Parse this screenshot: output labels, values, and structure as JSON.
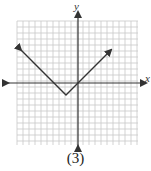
{
  "caption": "(3)",
  "chart_data": {
    "type": "line",
    "title": "",
    "xlabel": "x",
    "ylabel": "y",
    "xlim": [
      -10,
      10
    ],
    "ylim": [
      -10,
      10
    ],
    "grid": true,
    "function": "y = |x + 2| - 2",
    "vertex": [
      -2,
      -2
    ],
    "series": [
      {
        "name": "absolute value graph",
        "x": [
          -9.5,
          -2,
          5.5
        ],
        "y": [
          5.5,
          -2,
          5.5
        ],
        "arrows_at_ends": true
      }
    ],
    "axis_labels": {
      "x": "x",
      "y": "y"
    }
  },
  "colors": {
    "grid": "#c8c8c8",
    "axis": "#333333",
    "line": "#333333"
  }
}
